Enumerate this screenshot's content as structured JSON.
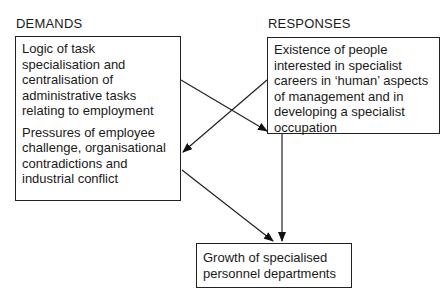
{
  "headings": {
    "demands": "DEMANDS",
    "responses": "RESPONSES"
  },
  "boxes": {
    "demands_1": "Logic of task specialisation and centralisation of administrative tasks relating to employment",
    "demands_2": "Pressures of employee challenge, organisational contradictions and industrial conflict",
    "responses": "Existence of people interested in specialist careers in ‘human’ aspects of management and in developing a specialist occupation",
    "outcome": "Growth of specialised personnel departments"
  },
  "arrows": [
    {
      "from": "demands_1",
      "to": "responses"
    },
    {
      "from": "responses",
      "to": "demands_2"
    },
    {
      "from": "demands_2",
      "to": "outcome"
    },
    {
      "from": "responses",
      "to": "outcome"
    }
  ]
}
